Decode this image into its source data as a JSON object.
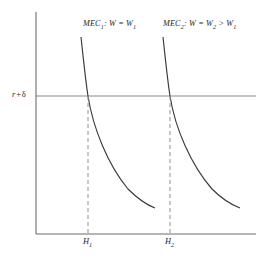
{
  "figure": {
    "type": "economics-diagram",
    "title": "",
    "background_color": "#ffffff"
  },
  "axes": {
    "y_axis": {
      "name": "vertical-axis",
      "x": 36,
      "y_top": 12,
      "y_bottom": 234,
      "color": "#6d6d6d"
    },
    "x_axis": {
      "name": "horizontal-axis",
      "y": 234,
      "x_left": 36,
      "x_right": 256,
      "color": "#6d6d6d"
    },
    "y_tick_label": "r + δ",
    "y_tick_label_parts": {
      "symbol": "r",
      "operator": "+",
      "greek": "δ"
    },
    "x_tick_labels": [
      "H",
      "H"
    ],
    "x_tick_label_1": {
      "base": "H",
      "sub": "1",
      "x": 88
    },
    "x_tick_label_2": {
      "base": "H",
      "sub": "2",
      "x": 170
    }
  },
  "threshold": {
    "name": "r-plus-delta-line",
    "label": "r + δ",
    "y": 96,
    "x_start": 36,
    "x_end": 256,
    "color": "#8a8a8a"
  },
  "curves": [
    {
      "id": "mec1",
      "label_base": "MEC",
      "label_sub": "1",
      "label_rest": ": W = W",
      "label_rest_sub": "1",
      "label_full": "MEC₁ : W = W₁",
      "color": "#3a3a3a",
      "intersection_x": 88,
      "intersection_y": 96,
      "path": "M 81,37 C 83.5,60 85.5,80 88,96 C 93,128 108,165 128,189 C 138,199 147,205 155,208"
    },
    {
      "id": "mec2",
      "label_base": "MEC",
      "label_sub": "2",
      "label_rest": ": W = W",
      "label_rest_sub": "2",
      "label_rest2": " > W",
      "label_rest2_sub": "1",
      "label_full": "MEC₂ : W = W₂ > W₁",
      "color": "#3a3a3a",
      "intersection_x": 170,
      "intersection_y": 96,
      "path": "M 163,37 C 165.5,60 167.5,80 170,96 C 175,128 191,165 212,189 C 222,199 232,205 240,208"
    }
  ],
  "drop_lines": [
    {
      "id": "drop-h1",
      "x": 88,
      "y_top": 96,
      "y_bottom": 234,
      "color": "#9a9a9a",
      "dashed": true
    },
    {
      "id": "drop-h2",
      "x": 170,
      "y_top": 96,
      "y_bottom": 234,
      "color": "#9a9a9a",
      "dashed": true
    }
  ],
  "chart_data": {
    "type": "line",
    "title": "",
    "xlabel": "",
    "ylabel": "",
    "legend": [
      "MEC₁ : W = W₁",
      "MEC₂ : W = W₂ > W₁"
    ],
    "annotations": [
      "r + δ",
      "H₁",
      "H₂"
    ],
    "series": [
      {
        "name": "MEC₁ : W = W₁",
        "note": "downward-sloping convex marginal efficiency of capital curve for wage W₁"
      },
      {
        "name": "MEC₂ : W = W₂ > W₁",
        "note": "marginal efficiency of capital curve shifted right for higher wage W₂"
      }
    ],
    "reference_lines": [
      {
        "name": "r + δ",
        "orientation": "horizontal"
      },
      {
        "name": "H₁",
        "orientation": "vertical",
        "dashed": true
      },
      {
        "name": "H₂",
        "orientation": "vertical",
        "dashed": true
      }
    ],
    "grid": false,
    "legend_position": "inside-top"
  }
}
